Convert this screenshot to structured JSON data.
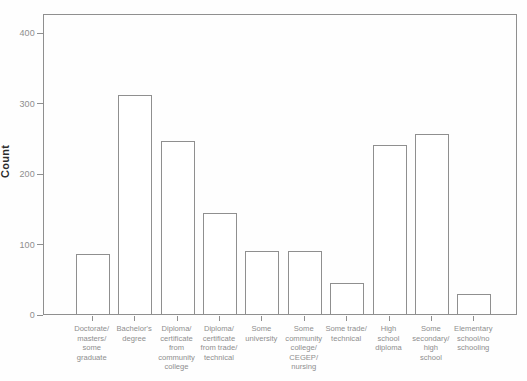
{
  "chart_data": {
    "type": "bar",
    "title": "",
    "xlabel": "",
    "ylabel": "Count",
    "ylim": [
      0,
      427
    ],
    "yticks": [
      0,
      100,
      200,
      300,
      400
    ],
    "grid": false,
    "legend": null,
    "bar_fill": "#ffffff",
    "bar_border": "#8f8f8f",
    "axis_color": "#8f8f8f",
    "tick_label_color": "#8e8e8e",
    "categories": [
      "Doctorate/masters/some graduate",
      "Bachelor's degree",
      "Diploma/certificate from community college",
      "Diploma/certificate from trade/technical",
      "Some university",
      "Some community college/CEGEP/nursing",
      "Some trade/technical",
      "High school diploma",
      "Some secondary/high school",
      "Elementary school/no schooling"
    ],
    "category_lines": [
      [
        "Doctorate/",
        "masters/",
        "some",
        "graduate"
      ],
      [
        "Bachelor's",
        "degree"
      ],
      [
        "Diploma/",
        "certificate",
        "from",
        "community",
        "college"
      ],
      [
        "Diploma/",
        "certificate",
        "from trade/",
        "technical"
      ],
      [
        "Some",
        "university"
      ],
      [
        "Some",
        "community",
        "college/",
        "CEGEP/",
        "nursing"
      ],
      [
        "Some trade/",
        "technical"
      ],
      [
        "High",
        "school",
        "diploma"
      ],
      [
        "Some",
        "secondary/",
        "high",
        "school"
      ],
      [
        "Elementary",
        "school/no",
        "schooling"
      ]
    ],
    "values": [
      85,
      310,
      245,
      143,
      89,
      90,
      44,
      240,
      255,
      28
    ]
  }
}
